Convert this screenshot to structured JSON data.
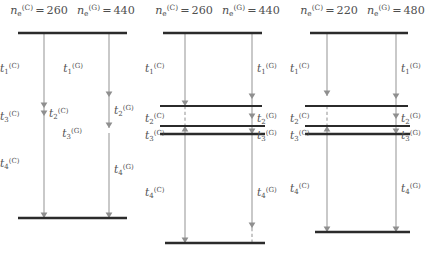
{
  "figure": {
    "type": "level-transition-diagram",
    "symbols": {
      "n": "n",
      "sub_e": "e",
      "sup_C": "(C)",
      "sup_G": "(G)",
      "equals": "=",
      "t": "t"
    },
    "panels": [
      {
        "id": "panel-0",
        "header": {
          "c_label": "n",
          "c_sub": "e",
          "c_sup": "(C)",
          "c_eq": "=",
          "c_value": "260",
          "g_label": "n",
          "g_sub": "e",
          "g_sup": "(G)",
          "g_eq": "=",
          "g_value": "440"
        },
        "has_intermediate_levels": false,
        "levels": [
          {
            "name": "top-level",
            "y": 33,
            "x1": 18,
            "x2": 127,
            "weight": "thick"
          },
          {
            "name": "bottom-level",
            "y": 218,
            "x1": 18,
            "x2": 127,
            "weight": "thick"
          }
        ],
        "columns": [
          {
            "name": "C",
            "x": 44,
            "transitions": [
              {
                "name": "t1",
                "label_t": "t",
                "label_sub": "1",
                "label_sup": "(C)",
                "y_from": 33,
                "y_to": 108,
                "style": "solid",
                "arrowhead": true,
                "label_x": 18,
                "label_y": 62,
                "label_align": "right"
              },
              {
                "name": "t3",
                "label_t": "t",
                "label_sub": "3",
                "label_sup": "(C)",
                "y_from": 108,
                "y_to": 116,
                "style": "solid",
                "arrowhead": true,
                "label_x": 10,
                "label_y": 110,
                "label_align": "right"
              },
              {
                "name": "t2",
                "label_t": "t",
                "label_sub": "2",
                "label_sup": "(C)",
                "y_from": 108,
                "y_to": 113,
                "style": "none",
                "arrowhead": false,
                "label_x": 49,
                "label_y": 107,
                "label_align": "left"
              },
              {
                "name": "t4",
                "label_t": "t",
                "label_sub": "4",
                "label_sup": "(C)",
                "y_from": 116,
                "y_to": 218,
                "style": "solid",
                "arrowhead": true,
                "label_x": 18,
                "label_y": 157,
                "label_align": "right"
              }
            ]
          },
          {
            "name": "G",
            "x": 109,
            "transitions": [
              {
                "name": "t1",
                "label_t": "t",
                "label_sub": "1",
                "label_sup": "(G)",
                "y_from": 33,
                "y_to": 97,
                "style": "solid",
                "arrowhead": true,
                "label_x": 83,
                "label_y": 62,
                "label_align": "right"
              },
              {
                "name": "t2",
                "label_t": "t",
                "label_sub": "2",
                "label_sup": "(G)",
                "y_from": 97,
                "y_to": 128,
                "style": "solid",
                "arrowhead": true,
                "label_x": 114,
                "label_y": 104,
                "label_align": "left"
              },
              {
                "name": "t3",
                "label_t": "t",
                "label_sub": "3",
                "label_sup": "(G)",
                "y_from": 128,
                "y_to": 133,
                "style": "none",
                "arrowhead": false,
                "label_x": 82,
                "label_y": 127,
                "label_align": "right"
              },
              {
                "name": "t4",
                "label_t": "t",
                "label_sub": "4",
                "label_sup": "(G)",
                "y_from": 133,
                "y_to": 218,
                "style": "solid",
                "arrowhead": true,
                "label_x": 114,
                "label_y": 163,
                "label_align": "left"
              }
            ]
          }
        ]
      },
      {
        "id": "panel-1",
        "header": {
          "c_label": "n",
          "c_sub": "e",
          "c_sup": "(C)",
          "c_eq": "=",
          "c_value": "260",
          "g_label": "n",
          "g_sub": "e",
          "g_sup": "(G)",
          "g_eq": "=",
          "g_value": "440"
        },
        "has_intermediate_levels": true,
        "levels": [
          {
            "name": "top-level",
            "y": 33,
            "x1": 18,
            "x2": 117,
            "weight": "thick"
          },
          {
            "name": "level-2",
            "y": 106,
            "x1": 15,
            "x2": 117,
            "weight": "thin"
          },
          {
            "name": "level-3a",
            "y": 126,
            "x1": 15,
            "x2": 120,
            "weight": "thin"
          },
          {
            "name": "level-3b",
            "y": 134,
            "x1": 15,
            "x2": 120,
            "weight": "thick"
          },
          {
            "name": "bottom-level",
            "y": 243,
            "x1": 20,
            "x2": 120,
            "weight": "thick"
          }
        ],
        "columns": [
          {
            "name": "C",
            "x": 40,
            "transitions": [
              {
                "name": "t1",
                "label_t": "t",
                "label_sub": "1",
                "label_sup": "(C)",
                "y_from": 33,
                "y_to": 106,
                "style": "solid",
                "arrowhead": true,
                "label_x": 15,
                "label_y": 62,
                "label_align": "right"
              },
              {
                "name": "t2",
                "label_t": "t",
                "label_sub": "2",
                "label_sup": "(C)",
                "y_from": 106,
                "y_to": 126,
                "style": "dashed",
                "arrowhead": false,
                "label_x": 13,
                "label_y": 112,
                "label_align": "right"
              },
              {
                "name": "t3",
                "label_t": "t",
                "label_sub": "3",
                "label_sup": "(C)",
                "y_from": 134,
                "y_to": 126,
                "style": "solid",
                "arrowhead": true,
                "label_x": 13,
                "label_y": 129,
                "label_align": "right"
              },
              {
                "name": "t4",
                "label_t": "t",
                "label_sub": "4",
                "label_sup": "(C)",
                "y_from": 134,
                "y_to": 243,
                "style": "solid",
                "arrowhead": true,
                "label_x": 15,
                "label_y": 186,
                "label_align": "right"
              }
            ]
          },
          {
            "name": "G",
            "x": 107,
            "transitions": [
              {
                "name": "t1",
                "label_t": "t",
                "label_sub": "1",
                "label_sup": "(G)",
                "y_from": 33,
                "y_to": 99,
                "style": "solid",
                "arrowhead": true,
                "label_x": 112,
                "label_y": 62,
                "label_align": "left"
              },
              {
                "name": "t2",
                "label_t": "t",
                "label_sub": "2",
                "label_sup": "(G)",
                "y_from": 99,
                "y_to": 119,
                "style": "solid",
                "arrowhead": true,
                "label_x": 112,
                "label_y": 112,
                "label_align": "left"
              },
              {
                "name": "t3",
                "label_t": "t",
                "label_sub": "3",
                "label_sup": "(G)",
                "y_from": 119,
                "y_to": 134,
                "style": "solid",
                "arrowhead": true,
                "label_x": 112,
                "label_y": 129,
                "label_align": "left"
              },
              {
                "name": "t4",
                "label_t": "t",
                "label_sub": "4",
                "label_sup": "(G)",
                "y_from": 134,
                "y_to": 228,
                "style": "solid",
                "arrowhead": true,
                "label_x": 112,
                "label_y": 186,
                "label_align": "left"
              },
              {
                "name": "t4-tail",
                "label_t": "",
                "label_sub": "",
                "label_sup": "",
                "y_from": 228,
                "y_to": 243,
                "style": "dashed",
                "arrowhead": false,
                "label_x": 0,
                "label_y": 0,
                "label_align": "left"
              }
            ]
          }
        ]
      },
      {
        "id": "panel-2",
        "header": {
          "c_label": "n",
          "c_sub": "e",
          "c_sup": "(C)",
          "c_eq": "=",
          "c_value": "220",
          "g_label": "n",
          "g_sub": "e",
          "g_sup": "(G)",
          "g_eq": "=",
          "g_value": "480"
        },
        "has_intermediate_levels": true,
        "levels": [
          {
            "name": "top-level",
            "y": 33,
            "x1": 20,
            "x2": 118,
            "weight": "thick"
          },
          {
            "name": "level-2",
            "y": 106,
            "x1": 15,
            "x2": 118,
            "weight": "thin"
          },
          {
            "name": "level-3a",
            "y": 126,
            "x1": 15,
            "x2": 120,
            "weight": "thin"
          },
          {
            "name": "level-3b",
            "y": 134,
            "x1": 15,
            "x2": 120,
            "weight": "thick"
          },
          {
            "name": "bottom-level",
            "y": 232,
            "x1": 25,
            "x2": 120,
            "weight": "thick"
          }
        ],
        "columns": [
          {
            "name": "C",
            "x": 37,
            "transitions": [
              {
                "name": "t1",
                "label_t": "t",
                "label_sub": "1",
                "label_sup": "(C)",
                "y_from": 33,
                "y_to": 96,
                "style": "solid",
                "arrowhead": true,
                "label_x": 14,
                "label_y": 62,
                "label_align": "right"
              },
              {
                "name": "t2",
                "label_t": "t",
                "label_sub": "2",
                "label_sup": "(C)",
                "y_from": 106,
                "y_to": 126,
                "style": "dashed",
                "arrowhead": false,
                "label_x": 13,
                "label_y": 112,
                "label_align": "right"
              },
              {
                "name": "t3",
                "label_t": "t",
                "label_sub": "3",
                "label_sup": "(C)",
                "y_from": 134,
                "y_to": 126,
                "style": "solid",
                "arrowhead": true,
                "label_x": 13,
                "label_y": 129,
                "label_align": "right"
              },
              {
                "name": "t4",
                "label_t": "t",
                "label_sub": "4",
                "label_sup": "(C)",
                "y_from": 134,
                "y_to": 232,
                "style": "solid",
                "arrowhead": true,
                "label_x": 14,
                "label_y": 182,
                "label_align": "right"
              }
            ]
          },
          {
            "name": "G",
            "x": 106,
            "transitions": [
              {
                "name": "t1",
                "label_t": "t",
                "label_sub": "1",
                "label_sup": "(G)",
                "y_from": 33,
                "y_to": 99,
                "style": "solid",
                "arrowhead": true,
                "label_x": 111,
                "label_y": 62,
                "label_align": "left"
              },
              {
                "name": "t2",
                "label_t": "t",
                "label_sub": "2",
                "label_sup": "(G)",
                "y_from": 99,
                "y_to": 119,
                "style": "solid",
                "arrowhead": true,
                "label_x": 111,
                "label_y": 112,
                "label_align": "left"
              },
              {
                "name": "t3",
                "label_t": "t",
                "label_sub": "3",
                "label_sup": "(G)",
                "y_from": 119,
                "y_to": 134,
                "style": "solid",
                "arrowhead": true,
                "label_x": 111,
                "label_y": 129,
                "label_align": "left"
              },
              {
                "name": "t4",
                "label_t": "t",
                "label_sub": "4",
                "label_sup": "(G)",
                "y_from": 134,
                "y_to": 232,
                "style": "solid",
                "arrowhead": true,
                "label_x": 111,
                "label_y": 182,
                "label_align": "left"
              }
            ]
          }
        ]
      }
    ],
    "colors": {
      "level_line": "#2b2b2b",
      "arrow_line": "#a8a8a8",
      "arrow_head": "#8f8f8f",
      "text": "#4f4f4f",
      "background": "#ffffff"
    }
  }
}
